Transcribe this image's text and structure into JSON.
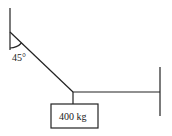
{
  "diagram": {
    "type": "statics-rope-tension",
    "angle_label": "45°",
    "mass_label": "400 kg",
    "colors": {
      "stroke": "#222222",
      "background": "#ffffff"
    }
  }
}
